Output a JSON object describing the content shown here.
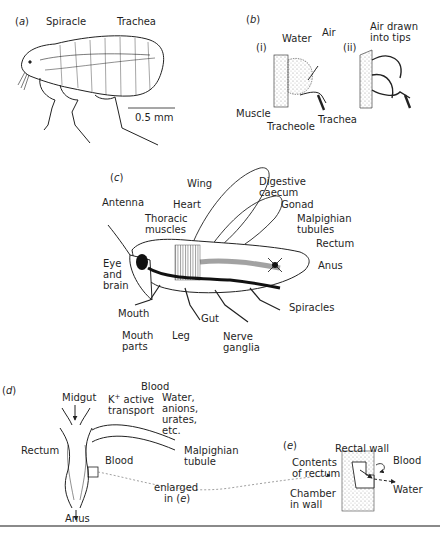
{
  "figure": {
    "panels": {
      "a": {
        "tag": "a",
        "labels": {
          "spiracle": "Spiracle",
          "trachea": "Trachea",
          "scale": "0.5 mm"
        }
      },
      "b": {
        "tag": "b",
        "sub_i": "(i)",
        "sub_ii": "(ii)",
        "labels": {
          "water": "Water",
          "air": "Air",
          "air_drawn": "Air drawn\ninto tips",
          "muscle": "Muscle",
          "tracheole": "Tracheole",
          "trachea": "Trachea"
        }
      },
      "c": {
        "tag": "c",
        "labels": {
          "wing": "Wing",
          "heart": "Heart",
          "antenna": "Antenna",
          "thoracic_muscles": "Thoracic\nmuscles",
          "digestive_caecum": "Digestive\ncaecum",
          "gonad": "Gonad",
          "malpighian_tubules": "Malpighian\ntubules",
          "rectum": "Rectum",
          "anus": "Anus",
          "eye_brain": "Eye\nand\nbrain",
          "mouth": "Mouth",
          "mouth_parts": "Mouth\nparts",
          "leg": "Leg",
          "gut": "Gut",
          "nerve_ganglia": "Nerve\nganglia",
          "spiracles": "Spiracles"
        }
      },
      "d": {
        "tag": "d",
        "labels": {
          "blood_top": "Blood",
          "midgut": "Midgut",
          "k_active": "K",
          "k_sup": "+",
          "k_rest": " active\ntransport",
          "water_anions": "Water,\nanions,\nurates,\netc.",
          "rectum": "Rectum",
          "blood": "Blood",
          "malpighian_tubule": "Malpighian\ntubule",
          "enlarged": "enlarged",
          "in_e": "in (",
          "in_e_tag": "e",
          "in_e_close": ")",
          "anus": "Anus"
        }
      },
      "e": {
        "tag": "e",
        "labels": {
          "rectal_wall": "Rectal wall",
          "blood": "Blood",
          "contents": "Contents\nof rectum",
          "chamber": "Chamber\nin wall",
          "water": "Water"
        }
      }
    },
    "colors": {
      "ink": "#1f1f1f",
      "stipple": "#cfcfcf",
      "rule": "#8a8a8a"
    }
  }
}
